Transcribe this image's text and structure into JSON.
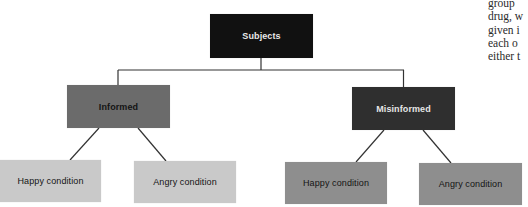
{
  "diagram": {
    "type": "tree",
    "root": {
      "label": "Subjects",
      "color": "#111111",
      "text_color": "#e8e8e8"
    },
    "groups": [
      {
        "label": "Informed",
        "color": "#6b6b6b",
        "text_color": "#141414",
        "conditions": [
          {
            "label": "Happy condition",
            "color": "#c9c9c9"
          },
          {
            "label": "Angry condition",
            "color": "#c9c9c9"
          }
        ]
      },
      {
        "label": "Misinformed",
        "color": "#2f2f2f",
        "text_color": "#e6e6e6",
        "conditions": [
          {
            "label": "Happy condition",
            "color": "#8e8e8e"
          },
          {
            "label": "Angry condition",
            "color": "#8e8e8e"
          }
        ]
      }
    ],
    "connector_color": "#333333"
  },
  "side_text": {
    "lines": [
      "group",
      "drug, w",
      "given i",
      "each o",
      "either t"
    ]
  }
}
